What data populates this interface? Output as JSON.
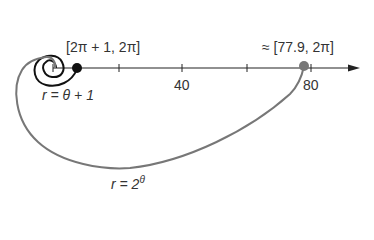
{
  "diagram": {
    "type": "polar spiral comparison",
    "axis": {
      "ticks": [
        {
          "value": 20,
          "label": ""
        },
        {
          "value": 40,
          "label": "40"
        },
        {
          "value": 60,
          "label": ""
        },
        {
          "value": 80,
          "label": "80"
        }
      ]
    },
    "curves": [
      {
        "name": "r = θ + 1",
        "label_prefix": "r = θ + 1",
        "color": "#111111"
      },
      {
        "name": "r = 2^θ",
        "label_base": "r = 2",
        "label_exp": "θ",
        "color": "#777777"
      }
    ],
    "points": [
      {
        "label": "[2π + 1, 2π]",
        "color": "#111111"
      },
      {
        "label": "≈ [77.9, 2π]",
        "color": "#777777"
      }
    ]
  }
}
